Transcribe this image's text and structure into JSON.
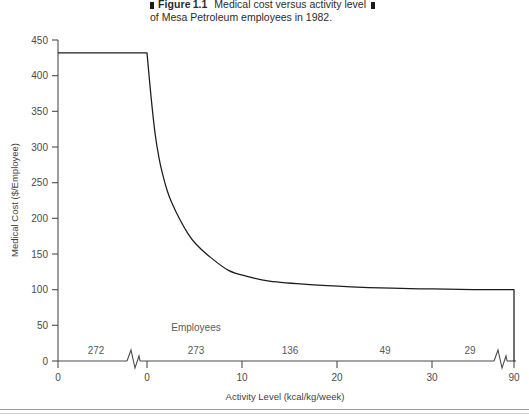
{
  "caption": {
    "figure_word": "Figure",
    "figure_number": "1.1",
    "line1": "Medical cost versus activity level",
    "line2": "of Mesa Petroleum employees in 1982."
  },
  "chart_data": {
    "type": "line",
    "title": "Medical cost versus activity level of Mesa Petroleum employees in 1982.",
    "xlabel": "Activity Level (kcal/kg/week)",
    "ylabel": "Medical Cost ($/Employee)",
    "xlim": [
      0,
      90
    ],
    "ylim": [
      0,
      450
    ],
    "grid": false,
    "legend": null,
    "broken_axis": true,
    "x_ticks": [
      "0",
      "0",
      "10",
      "20",
      "30",
      "90"
    ],
    "x_tick_values": [
      -1,
      0,
      10,
      20,
      30,
      90
    ],
    "y_ticks": [
      "0",
      "50",
      "100",
      "150",
      "200",
      "250",
      "300",
      "350",
      "400",
      "450"
    ],
    "y_tick_values": [
      0,
      50,
      100,
      150,
      200,
      250,
      300,
      350,
      400,
      450
    ],
    "x": [
      0,
      1,
      2,
      3,
      4,
      5,
      6,
      8,
      10,
      12,
      15,
      20,
      25,
      30,
      40,
      50,
      60,
      70,
      80,
      90
    ],
    "values": [
      432,
      370,
      318,
      283,
      258,
      238,
      223,
      199,
      179,
      164,
      148,
      127,
      118,
      112,
      107,
      104,
      102,
      101,
      100,
      100
    ],
    "pre_break_value": 432,
    "annotations": [
      {
        "text": "Employees",
        "role": "counts-header"
      }
    ],
    "employee_counts": [
      {
        "label": "272",
        "segment": "pre-break"
      },
      {
        "label": "273",
        "segment": "0-10"
      },
      {
        "label": "136",
        "segment": "10-20"
      },
      {
        "label": "49",
        "segment": "20-30"
      },
      {
        "label": "29",
        "segment": "30-90"
      }
    ]
  }
}
